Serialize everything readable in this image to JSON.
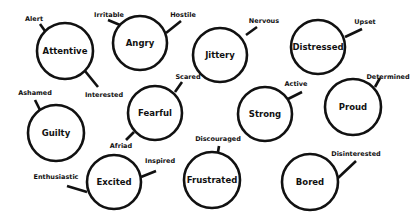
{
  "colors": {
    "stroke": "#111111",
    "background": "#ffffff"
  },
  "nodes": [
    {
      "id": "attentive",
      "label": "Attentive",
      "cx": 65,
      "cy": 51,
      "r": 28,
      "spokes": [
        {
          "label": "Alert",
          "x1": 45,
          "y1": 31,
          "x2": 40,
          "y2": 24,
          "lx": 34,
          "ly": 19
        },
        {
          "label": "Interested",
          "x1": 85,
          "y1": 71,
          "x2": 98,
          "y2": 87,
          "lx": 104,
          "ly": 95
        }
      ]
    },
    {
      "id": "angry",
      "label": "Angry",
      "cx": 140,
      "cy": 43,
      "r": 27,
      "spokes": [
        {
          "label": "Irritable",
          "x1": 120,
          "y1": 25,
          "x2": 108,
          "y2": 20,
          "lx": 109,
          "ly": 15
        },
        {
          "label": "Hostile",
          "x1": 166,
          "y1": 33,
          "x2": 181,
          "y2": 21,
          "lx": 183,
          "ly": 15
        }
      ]
    },
    {
      "id": "jittery",
      "label": "Jittery",
      "cx": 220,
      "cy": 55,
      "r": 27,
      "spokes": [
        {
          "label": "Nervous",
          "x1": 246,
          "y1": 35,
          "x2": 257,
          "y2": 27,
          "lx": 264,
          "ly": 21
        }
      ]
    },
    {
      "id": "distressed",
      "label": "Distressed",
      "cx": 318,
      "cy": 47,
      "r": 27,
      "spokes": [
        {
          "label": "Upset",
          "x1": 345,
          "y1": 37,
          "x2": 362,
          "y2": 29,
          "lx": 365,
          "ly": 22
        }
      ]
    },
    {
      "id": "guilty",
      "label": "Guilty",
      "cx": 56,
      "cy": 133,
      "r": 28,
      "spokes": [
        {
          "label": "Ashamed",
          "x1": 40,
          "y1": 110,
          "x2": 35,
          "y2": 100,
          "lx": 35,
          "ly": 93
        }
      ]
    },
    {
      "id": "fearful",
      "label": "Fearful",
      "cx": 155,
      "cy": 113,
      "r": 27,
      "spokes": [
        {
          "label": "Scared",
          "x1": 175,
          "y1": 92,
          "x2": 182,
          "y2": 82,
          "lx": 188,
          "ly": 77
        },
        {
          "label": "Afriad",
          "x1": 134,
          "y1": 132,
          "x2": 126,
          "y2": 140,
          "lx": 121,
          "ly": 146
        }
      ]
    },
    {
      "id": "strong",
      "label": "Strong",
      "cx": 265,
      "cy": 114,
      "r": 27,
      "spokes": [
        {
          "label": "Active",
          "x1": 288,
          "y1": 99,
          "x2": 302,
          "y2": 92,
          "lx": 296,
          "ly": 84
        }
      ]
    },
    {
      "id": "proud",
      "label": "Proud",
      "cx": 353,
      "cy": 107,
      "r": 28,
      "spokes": [
        {
          "label": "Determined",
          "x1": 375,
          "y1": 87,
          "x2": 380,
          "y2": 78,
          "lx": 388,
          "ly": 77
        }
      ]
    },
    {
      "id": "excited",
      "label": "Excited",
      "cx": 114,
      "cy": 182,
      "r": 27,
      "spokes": [
        {
          "label": "Enthusiastic",
          "x1": 87,
          "y1": 192,
          "x2": 67,
          "y2": 186,
          "lx": 56,
          "ly": 177
        },
        {
          "label": "Inspired",
          "x1": 141,
          "y1": 177,
          "x2": 156,
          "y2": 171,
          "lx": 160,
          "ly": 161
        }
      ]
    },
    {
      "id": "frustrated",
      "label": "Frustrated",
      "cx": 212,
      "cy": 180,
      "r": 28,
      "spokes": [
        {
          "label": "Discouraged",
          "x1": 218,
          "y1": 152,
          "x2": 219,
          "y2": 146,
          "lx": 218,
          "ly": 139
        }
      ]
    },
    {
      "id": "bored",
      "label": "Bored",
      "cx": 310,
      "cy": 182,
      "r": 28,
      "spokes": [
        {
          "label": "Disinterested",
          "x1": 338,
          "y1": 178,
          "x2": 356,
          "y2": 161,
          "lx": 356,
          "ly": 154
        }
      ]
    }
  ]
}
